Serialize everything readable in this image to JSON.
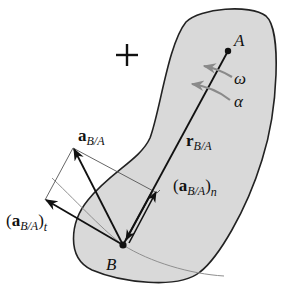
{
  "diagram": {
    "type": "rigid-body-relative-acceleration",
    "colors": {
      "body_fill": "#d9d9d9",
      "body_stroke": "#222222",
      "vector": "#111111",
      "rotation_arrows": "#8a8a8a",
      "path_curve": "#8f8f8f",
      "construction_lines": "#555555"
    },
    "sign_convention": "+",
    "points": {
      "A": {
        "label": "A"
      },
      "B": {
        "label": "B"
      }
    },
    "rotation": {
      "omega": "ω",
      "alpha": "α"
    },
    "vectors": {
      "r": {
        "base": "r",
        "sub": "B/A"
      },
      "a": {
        "base": "a",
        "sub": "B/A"
      },
      "a_t": {
        "open": "(",
        "base": "a",
        "sub": "B/A",
        "close": ")",
        "sub2": "t"
      },
      "a_n": {
        "open": "(",
        "base": "a",
        "sub": "B/A",
        "close": ")",
        "sub2": "n"
      }
    }
  }
}
